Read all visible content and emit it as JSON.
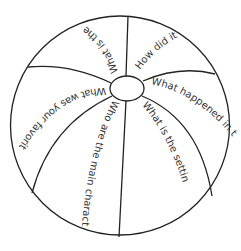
{
  "diagram": {
    "type": "beach-ball",
    "colors": {
      "outline": "#222222",
      "text": "#333333",
      "background": "#ffffff"
    },
    "segments": [
      {
        "id": "top-left",
        "question": "What is the"
      },
      {
        "id": "top-right",
        "question": "How did it e"
      },
      {
        "id": "right",
        "question": "What happened in the"
      },
      {
        "id": "bottom-right",
        "question": "What is the setting?"
      },
      {
        "id": "bottom-left",
        "question": "Who are the main characters?"
      },
      {
        "id": "left",
        "question": "What was your favorite par"
      }
    ]
  }
}
